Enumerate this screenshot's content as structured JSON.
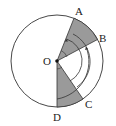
{
  "figure": {
    "type": "geometry",
    "points": {
      "A": {
        "label": "A"
      },
      "B": {
        "label": "B"
      },
      "C": {
        "label": "C"
      },
      "D": {
        "label": "D"
      },
      "O": {
        "label": "O"
      }
    },
    "shaded_sectors": [
      "AOB",
      "DOC"
    ],
    "colors": {
      "shade": "#9a9a9a",
      "stroke": "#333333",
      "background": "#ffffff"
    }
  }
}
